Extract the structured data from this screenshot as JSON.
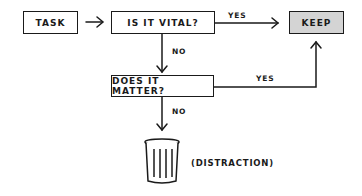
{
  "diagram": {
    "nodes": {
      "task": "TASK",
      "vital": "IS IT VITAL?",
      "keep": "KEEP",
      "matter": "DOES IT MATTER?",
      "distraction": "(DISTRACTION)"
    },
    "edges": {
      "vital_yes": "YES",
      "vital_no": "NO",
      "matter_yes": "YES",
      "matter_no": "NO"
    },
    "colors": {
      "keep_fill": "#d4d4d4",
      "stroke": "#1a1a1a"
    }
  }
}
